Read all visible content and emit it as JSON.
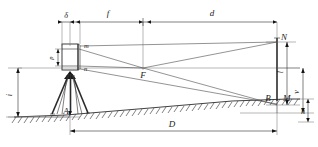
{
  "figure": {
    "type": "technical-line-diagram",
    "background_color": "#ffffff",
    "line_color": "#2b2b2b",
    "width": 318,
    "height": 147
  },
  "labels": {
    "delta": "δ",
    "f": "f",
    "d": "d",
    "D": "D",
    "h": "h",
    "i": "i",
    "l": "l",
    "v": "v",
    "p": "p",
    "m": "m",
    "n": "n",
    "F": "F",
    "A": "A",
    "B": "B",
    "M": "M",
    "N": "N"
  },
  "dimensions": {
    "top_chain": [
      {
        "key": "delta",
        "label": "δ",
        "position": "top",
        "span": "instrument-axis-to-objective"
      },
      {
        "key": "f",
        "label": "f",
        "position": "top",
        "span": "objective-to-focal-point"
      },
      {
        "key": "d",
        "label": "d",
        "position": "top",
        "span": "focal-point-to-staff"
      }
    ],
    "bottom_chain": [
      {
        "key": "D",
        "label": "D",
        "position": "bottom",
        "span": "station-A-to-staff-B"
      }
    ],
    "left_chain": [
      {
        "key": "i",
        "label": "i",
        "position": "left",
        "span": "ground-to-instrument-axis"
      }
    ],
    "right_chain": [
      {
        "key": "l",
        "label": "l",
        "position": "right-inner",
        "span": "M-to-N-staff-intercept"
      },
      {
        "key": "v",
        "label": "v",
        "position": "right-outer",
        "span": "staff-mid-to-ground"
      },
      {
        "key": "h",
        "label": "h",
        "position": "right-lower",
        "span": "ground-offset"
      }
    ],
    "instrument_chain": [
      {
        "key": "p",
        "label": "p",
        "position": "telescope-left",
        "span": "stadia-hair-spacing"
      }
    ]
  },
  "points": [
    {
      "key": "F",
      "label": "F",
      "role": "focal-point"
    },
    {
      "key": "A",
      "label": "A",
      "role": "instrument-station-ground-point"
    },
    {
      "key": "B",
      "label": "B",
      "role": "staff-base-ground-point"
    },
    {
      "key": "M",
      "label": "M",
      "role": "lower-stadia-reading-on-staff"
    },
    {
      "key": "N",
      "label": "N",
      "role": "upper-stadia-reading-on-staff"
    },
    {
      "key": "m",
      "label": "m",
      "role": "upper-stadia-hair-in-telescope"
    },
    {
      "key": "n",
      "label": "n",
      "role": "lower-stadia-hair-in-telescope"
    }
  ],
  "elements": {
    "tripod": "tripod-with-three-legs",
    "telescope": "telescope-box-with-objective",
    "staff": "vertical-levelling-staff",
    "ground": "sloping-hatched-ground-line",
    "sight_line": "horizontal-line-of-sight",
    "rays": "crossing-rays-through-focal-point"
  }
}
